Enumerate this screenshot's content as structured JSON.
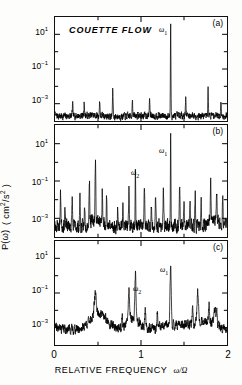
{
  "figure": {
    "annotation": "COUETTE FLOW",
    "xlabel_text": "RELATIVE FREQUENCY",
    "xlabel_symbol": "ω/Ω",
    "ylabel_main": "P(ω)",
    "ylabel_units": "( cm²/s² )",
    "xticks": [
      "0",
      "1",
      "2"
    ],
    "yticks": [
      "10¹",
      "10⁻¹",
      "10⁻³"
    ],
    "peak_label_1": "ω",
    "peak_label_1_sub": "1",
    "peak_label_2": "ω",
    "peak_label_2_sub": "2",
    "tag_a": "(a)",
    "tag_b": "(b)",
    "tag_c": "(c)"
  },
  "chart_data": {
    "type": "line",
    "title": "COUETTE FLOW",
    "xlabel": "RELATIVE FREQUENCY ω/Ω",
    "ylabel": "P(ω)  ( cm²/s² )",
    "xlim": [
      0,
      2
    ],
    "ylim_log": [
      0.0001,
      100.0
    ],
    "yscale": "log",
    "xticks": [
      0,
      1,
      2
    ],
    "yticks": [
      10,
      0.1,
      0.001
    ],
    "grid": false,
    "legend": "none",
    "panels": [
      {
        "tag": "(a)",
        "description": "Periodic regime: single sharp fundamental peak at ω₁ with flat broadband noise floor",
        "noise_floor": 0.0002,
        "peaks": [
          {
            "x": 1.345,
            "y": 30.0,
            "label": "ω₁"
          },
          {
            "x": 0.672,
            "y": 0.0008,
            "label": ""
          },
          {
            "x": 1.78,
            "y": 0.0012,
            "label": ""
          }
        ]
      },
      {
        "tag": "(b)",
        "description": "Quasiperiodic regime: two incommensurate frequencies ω₁ and ω₂ plus linear combinations",
        "noise_floor": 0.0004,
        "peaks": [
          {
            "x": 1.345,
            "y": 40.0,
            "label": "ω₁"
          },
          {
            "x": 0.935,
            "y": 0.32,
            "label": "ω₂"
          },
          {
            "x": 0.065,
            "y": 0.02,
            "label": ""
          },
          {
            "x": 0.4,
            "y": 0.09,
            "label": ""
          },
          {
            "x": 0.47,
            "y": 0.6,
            "label": ""
          },
          {
            "x": 1.04,
            "y": 0.05,
            "label": ""
          },
          {
            "x": 1.26,
            "y": 0.02,
            "label": ""
          },
          {
            "x": 1.45,
            "y": 0.05,
            "label": ""
          },
          {
            "x": 1.81,
            "y": 0.09,
            "label": ""
          },
          {
            "x": 1.88,
            "y": 0.02,
            "label": ""
          }
        ]
      },
      {
        "tag": "(c)",
        "description": "Weakly turbulent regime: broadened peaks at ω₁ and ω₂ on elevated broadband background",
        "noise_floor": 0.0008,
        "peaks": [
          {
            "x": 1.345,
            "y": 2.0,
            "label": "ω₁"
          },
          {
            "x": 0.935,
            "y": 0.35,
            "label": "ω₂"
          },
          {
            "x": 0.47,
            "y": 0.012,
            "label": ""
          },
          {
            "x": 0.86,
            "y": 0.008,
            "label": ""
          },
          {
            "x": 1.66,
            "y": 0.009,
            "label": ""
          },
          {
            "x": 1.86,
            "y": 0.006,
            "label": ""
          }
        ]
      }
    ]
  }
}
